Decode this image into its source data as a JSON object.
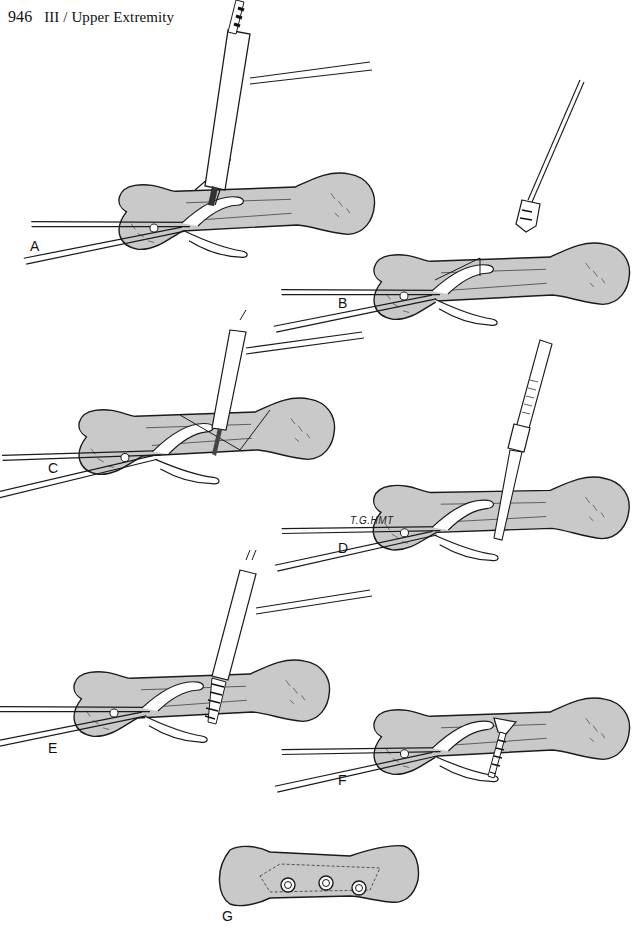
{
  "header": {
    "page_number": "946",
    "section": "III / Upper Extremity"
  },
  "colors": {
    "bone_fill": "#c9c9c9",
    "line": "#1a1a1a",
    "paper": "#ffffff"
  },
  "figure": {
    "panels": [
      {
        "id": "A",
        "label": "A",
        "step": "drill-with-guide"
      },
      {
        "id": "B",
        "label": "B",
        "step": "countersink"
      },
      {
        "id": "C",
        "label": "C",
        "step": "drill-far-cortex"
      },
      {
        "id": "D",
        "label": "D",
        "step": "depth-gauge"
      },
      {
        "id": "E",
        "label": "E",
        "step": "tap"
      },
      {
        "id": "F",
        "label": "F",
        "step": "screw-inserted"
      },
      {
        "id": "G",
        "label": "G",
        "step": "final-three-screws"
      }
    ],
    "signature": "T.G.HMT"
  }
}
